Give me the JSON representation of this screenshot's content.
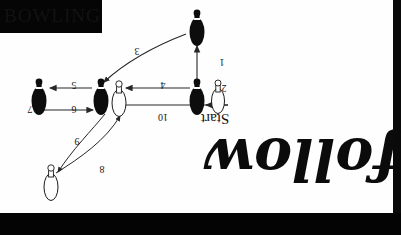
{
  "canvas": {
    "width": 401,
    "height": 235,
    "paper_color": "#fefefe",
    "border_color": "#040404"
  },
  "title_box": {
    "text": "BOWLING",
    "bg_color": "#050505",
    "text_color": "#121212"
  },
  "labels": {
    "start": "Start",
    "script_word": "follow"
  },
  "step_numbers": [
    {
      "id": "1",
      "value": "1",
      "x": 214,
      "y": 57
    },
    {
      "id": "2",
      "value": "2",
      "x": 216,
      "y": 83
    },
    {
      "id": "3",
      "value": "3",
      "x": 129,
      "y": 46
    },
    {
      "id": "4",
      "value": "4",
      "x": 155,
      "y": 80
    },
    {
      "id": "5",
      "value": "5",
      "x": 66,
      "y": 80
    },
    {
      "id": "6",
      "value": "6",
      "x": 66,
      "y": 104
    },
    {
      "id": "7",
      "value": "7",
      "x": 22,
      "y": 104
    },
    {
      "id": "8",
      "value": "8",
      "x": 94,
      "y": 164
    },
    {
      "id": "9",
      "value": "9",
      "x": 69,
      "y": 136
    },
    {
      "id": "10",
      "value": "10",
      "x": 155,
      "y": 112
    }
  ],
  "pins": [
    {
      "name": "pin-top",
      "fill": "black",
      "cx": 197,
      "cy": 28
    },
    {
      "name": "pin-start-black",
      "fill": "black",
      "cx": 197,
      "cy": 97
    },
    {
      "name": "pin-start-white",
      "fill": "white",
      "cx": 218,
      "cy": 97
    },
    {
      "name": "pin-center-black",
      "fill": "black",
      "cx": 101,
      "cy": 97
    },
    {
      "name": "pin-center-white",
      "fill": "white",
      "cx": 119,
      "cy": 99
    },
    {
      "name": "pin-left-black",
      "fill": "black",
      "cx": 39,
      "cy": 97
    },
    {
      "name": "pin-lower-white",
      "fill": "white",
      "cx": 51,
      "cy": 182
    }
  ],
  "colors": {
    "pin_black": "#0d0d0d",
    "pin_outline": "#1a1a1a",
    "arrow": "#2a2a2a"
  }
}
